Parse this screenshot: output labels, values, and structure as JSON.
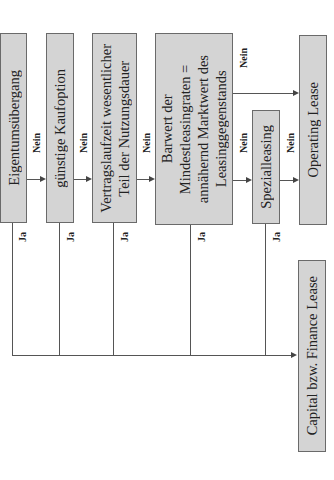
{
  "boxes": {
    "b1": "Eigentumsübergang",
    "b2": "günstige Kaufoption",
    "b3_l1": "Vertragslaufzeit wesentlicher",
    "b3_l2": "Teil der Nutzungsdauer",
    "b4_l1": "Barwert der",
    "b4_l2": "Mindestleasingraten =",
    "b4_l3": "annähernd Marktwert des",
    "b4_l4": "Leasinggegenstands",
    "b5": "Spezialleasing",
    "operating": "Operating Lease",
    "finance": "Capital bzw. Finance Lease"
  },
  "labels": {
    "yes": "Ja",
    "no": "Nein"
  },
  "colors": {
    "box_fill": "#d4d4d4",
    "box_border": "#6a6a6a",
    "line": "#555555"
  }
}
